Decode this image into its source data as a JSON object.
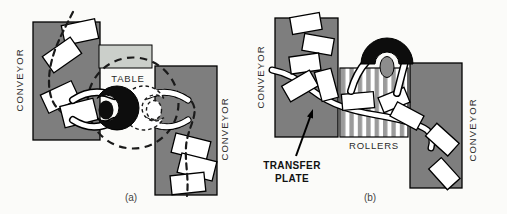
{
  "figure": {
    "caption_a": "(a)",
    "caption_b": "(b)"
  },
  "panel_a": {
    "left_conveyor_label": "CONVEYOR",
    "table_label": "TABLE",
    "right_conveyor_label": "CONVEYOR"
  },
  "panel_b": {
    "left_conveyor_label": "CONVEYOR",
    "rollers_label": "ROLLERS",
    "right_conveyor_label": "CONVEYOR",
    "transfer_plate_line1": "TRANSFER",
    "transfer_plate_line2": "PLATE"
  },
  "colors": {
    "background": "#fbfbf9",
    "conveyor_gray": "#7e7e7e",
    "bin_gray": "#cbcfca",
    "roller_stripe_gray": "#9b9b9b",
    "figure_black": "#0d0d0d",
    "head_b_gray": "#8d8d8d",
    "box_white": "#ffffff",
    "label_color": "#2b2b2b"
  }
}
